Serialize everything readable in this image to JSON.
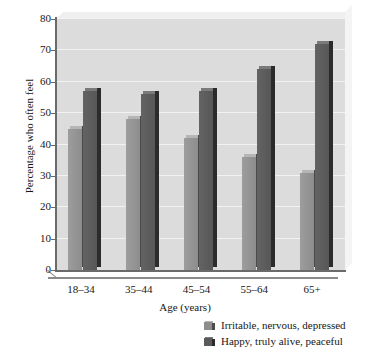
{
  "chart_data": {
    "type": "bar",
    "title": "",
    "xlabel": "Age (years)",
    "ylabel": "Percentage who often feel",
    "categories": [
      "18–34",
      "35–44",
      "45–54",
      "55–64",
      "65+"
    ],
    "series": [
      {
        "name": "Irritable, nervous, depressed",
        "color": "#8d8d8d",
        "values": [
          45,
          48,
          42,
          36,
          31
        ]
      },
      {
        "name": "Happy, truly alive, peaceful",
        "color": "#5a5a5a",
        "values": [
          57,
          56,
          57,
          64,
          72
        ]
      }
    ],
    "ylim": [
      0,
      80
    ],
    "yticks": [
      0,
      10,
      20,
      30,
      40,
      50,
      60,
      70,
      80
    ],
    "grid": true,
    "legend_position": "bottom-right",
    "plot_background": "#dcdcdc",
    "gridline_color": "#f2f2f2",
    "axis_color": "#6a6a6a"
  }
}
